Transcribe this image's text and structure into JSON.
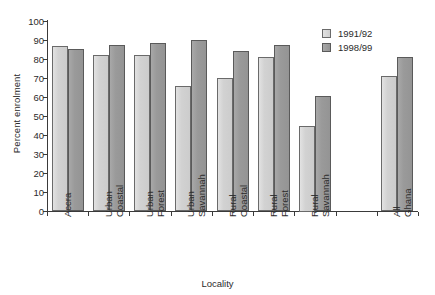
{
  "chart_data": {
    "type": "bar",
    "title": "",
    "xlabel": "Locality",
    "ylabel": "Percent enrolment",
    "ylim": [
      0,
      100
    ],
    "ytick_step": 10,
    "yticks": [
      0,
      10,
      20,
      30,
      40,
      50,
      60,
      70,
      80,
      90,
      100
    ],
    "grid": false,
    "legend_position": "top-right",
    "categories": [
      "Accra",
      "Urban Coastal",
      "Urban Forest",
      "Urban Savannah",
      "Rural Coastal",
      "Rural Forest",
      "Rural Savannah",
      "All Ghana"
    ],
    "category_lines": [
      [
        "Accra",
        ""
      ],
      [
        "Urban",
        "Coastal"
      ],
      [
        "Urban",
        "Forest"
      ],
      [
        "Urban",
        "Savannah"
      ],
      [
        "Rural",
        "Coastal"
      ],
      [
        "Rural",
        "Forest"
      ],
      [
        "Rural",
        "Savannah"
      ],
      [
        "All",
        "Ghana"
      ]
    ],
    "series": [
      {
        "name": "1991/92",
        "color": "#d6d6d6",
        "values": [
          87,
          82,
          82,
          66,
          70,
          81,
          45,
          71
        ]
      },
      {
        "name": "1998/99",
        "color": "#9a9a9a",
        "values": [
          85.5,
          87.5,
          88.5,
          90,
          84,
          87.5,
          60.5,
          81
        ]
      }
    ]
  },
  "legend": {
    "items": [
      {
        "label": "1991/92"
      },
      {
        "label": "1998/99"
      }
    ]
  },
  "axes": {
    "y_title": "Percent enrolment",
    "x_title": "Locality",
    "y_labels": [
      "100",
      "90",
      "80",
      "70",
      "60",
      "50",
      "40",
      "30",
      "20",
      "10",
      "0"
    ]
  }
}
